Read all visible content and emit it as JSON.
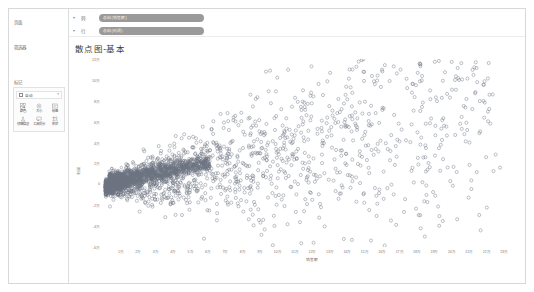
{
  "window": {
    "background_color": "#ffffff",
    "border_color": "#d8d8d8"
  },
  "sidebar": {
    "pages_label": "页面",
    "filters_label": "筛选器",
    "marks_label": "标记",
    "marks_card": {
      "mark_type": "自动",
      "chevron": "▾",
      "buttons": [
        {
          "label": "颜色",
          "icon": "color-icon"
        },
        {
          "label": "大小",
          "icon": "size-icon"
        },
        {
          "label": "标签",
          "icon": "label-icon"
        },
        {
          "label": "详细信息",
          "icon": "detail-icon"
        },
        {
          "label": "工具提示",
          "icon": "tooltip-icon"
        },
        {
          "label": "形状",
          "icon": "shape-icon"
        }
      ]
    }
  },
  "shelves": {
    "caret": "▾",
    "columns": {
      "name": "列",
      "pill": "总和(销售额)",
      "pill_color": "#9a9a9a"
    },
    "rows": {
      "name": "行",
      "pill": "总和(利润)",
      "pill_color": "#9a9a9a"
    }
  },
  "viz": {
    "title": "散点图-基本"
  },
  "chart_data": {
    "type": "scatter",
    "title": "散点图-基本",
    "xlabel": "销售额",
    "ylabel": "利润",
    "grid": false,
    "legend": false,
    "marker": {
      "shape": "circle-open",
      "color": "#6b7280",
      "radius": 1.6,
      "stroke_width": 0.45
    },
    "xlim": [
      0,
      240000
    ],
    "ylim": [
      -60000,
      120000
    ],
    "xticks": [
      "1万",
      "2万",
      "3万",
      "4万",
      "5万",
      "6万",
      "7万",
      "8万",
      "9万",
      "10万",
      "11万",
      "12万",
      "13万",
      "14万",
      "15万",
      "16万",
      "17万",
      "18万",
      "19万",
      "20万",
      "21万",
      "22万",
      "23万"
    ],
    "xtick_values": [
      10000,
      20000,
      30000,
      40000,
      50000,
      60000,
      70000,
      80000,
      90000,
      100000,
      110000,
      120000,
      130000,
      140000,
      150000,
      160000,
      170000,
      180000,
      190000,
      200000,
      210000,
      220000,
      230000
    ],
    "yticks": [
      "12万",
      "10万",
      "8万",
      "6万",
      "4万",
      "2万",
      "0",
      "-2万",
      "-4万",
      "-6万"
    ],
    "ytick_values": [
      120000,
      100000,
      80000,
      60000,
      40000,
      20000,
      0,
      -20000,
      -40000,
      -60000
    ],
    "point_count": 1742,
    "cluster": {
      "description": "dense elongated mass trending upward-right",
      "x_range": [
        4000,
        62000
      ],
      "y_range": [
        -8000,
        30000
      ]
    },
    "outliers": [
      {
        "x": 178000,
        "y": 96000
      },
      {
        "x": 137000,
        "y": 72000
      },
      {
        "x": 228000,
        "y": 16000
      },
      {
        "x": 58000,
        "y": -52000
      },
      {
        "x": 92000,
        "y": -34000
      },
      {
        "x": 116000,
        "y": 20000
      },
      {
        "x": 104000,
        "y": 40000
      }
    ]
  }
}
